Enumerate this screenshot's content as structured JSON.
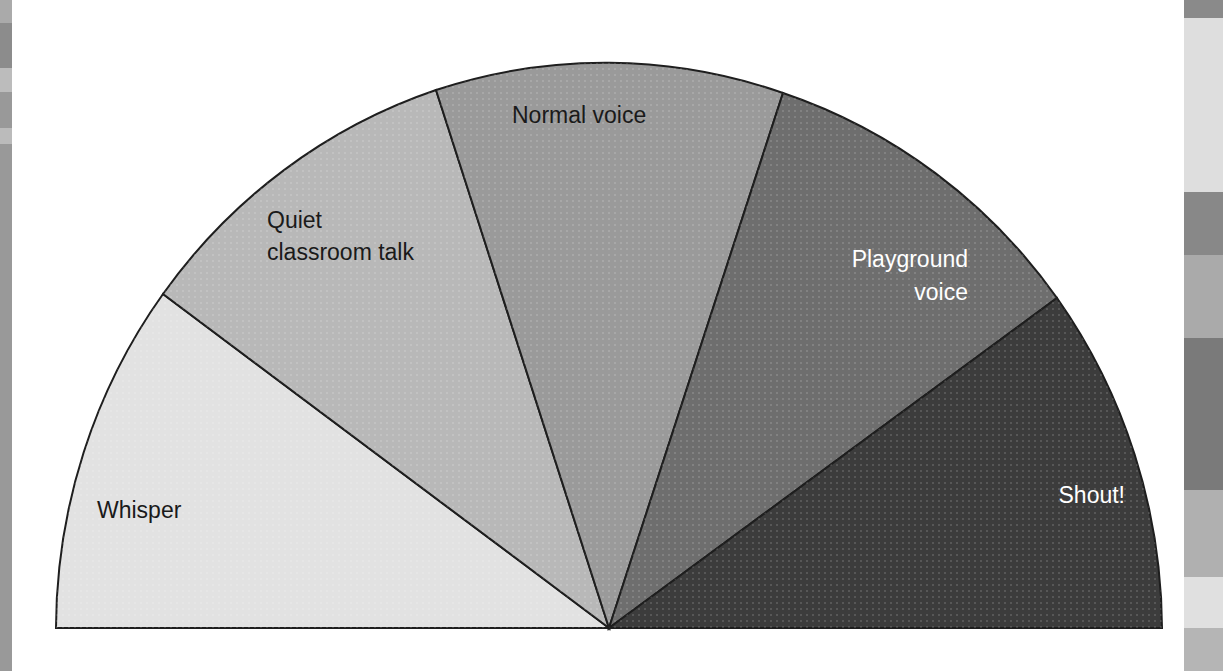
{
  "diagram": {
    "type": "voice-level-meter",
    "shape": "semicircle",
    "segments": [
      {
        "id": "whisper",
        "lines": [
          "Whisper"
        ],
        "fill": "#e2e2e2",
        "text_color": "#1a1a1a"
      },
      {
        "id": "quiet",
        "lines": [
          "Quiet",
          "classroom talk"
        ],
        "fill": "#b8b8b8",
        "text_color": "#1a1a1a"
      },
      {
        "id": "normal",
        "lines": [
          "Normal voice"
        ],
        "fill": "#9a9a9a",
        "text_color": "#1a1a1a"
      },
      {
        "id": "playground",
        "lines": [
          "Playground",
          "voice"
        ],
        "fill": "#6e6e6e",
        "text_color": "#ffffff"
      },
      {
        "id": "shout",
        "lines": [
          "Shout!"
        ],
        "fill": "#3c3c3c",
        "text_color": "#ffffff"
      }
    ],
    "outline_color": "#1e1e1e"
  },
  "decor": {
    "left_strip": [
      "#aaaaaa",
      "#8c8c8c",
      "#bcbcbc",
      "#999999",
      "#bbbbbb",
      "#999999"
    ],
    "right_strip": [
      "#8a8a8a",
      "#dedede",
      "#888888",
      "#aaaaaa",
      "#7a7a7a",
      "#b0b0b0",
      "#e0e0e0",
      "#b5b5b5"
    ]
  }
}
